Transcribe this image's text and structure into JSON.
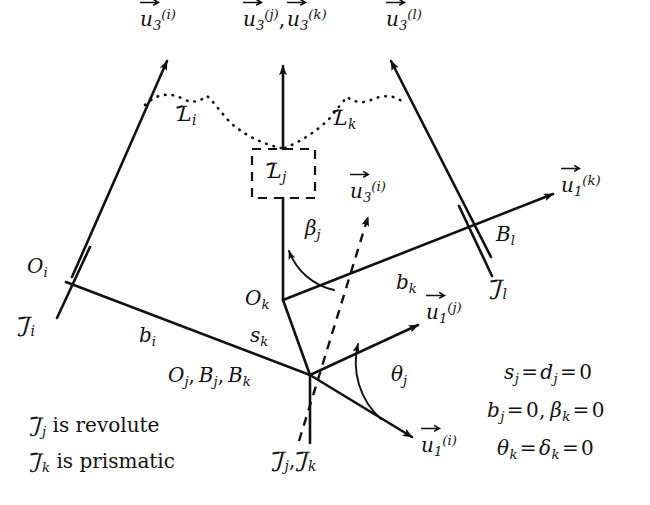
{
  "figure": {
    "type": "kinematic-chain-diagram",
    "stroke_color": "#111111",
    "background_color": "#ffffff",
    "width": 650,
    "height": 505
  },
  "vectors": {
    "u3_i_top": {
      "u": "u",
      "sub": "3",
      "sup": "(i)"
    },
    "u3_jk_top": {
      "u": "u",
      "sub": "3",
      "sup": "(j)",
      "u2": "u",
      "sub2": "3",
      "sup2": "(k)",
      "separator": ","
    },
    "u3_l_top": {
      "u": "u",
      "sub": "3",
      "sup": "(l)"
    },
    "u1_k_right": {
      "u": "u",
      "sub": "1",
      "sup": "(k)"
    },
    "u3_i_mid": {
      "u": "u",
      "sub": "3",
      "sup": "(i)"
    },
    "u1_j": {
      "u": "u",
      "sub": "1",
      "sup": "(j)"
    },
    "u1_i": {
      "u": "u",
      "sub": "1",
      "sup": "(i)"
    }
  },
  "links": {
    "L_i": {
      "letter": "L",
      "sub": "i"
    },
    "L_j": {
      "letter": "L",
      "sub": "j"
    },
    "L_k": {
      "letter": "L",
      "sub": "k"
    }
  },
  "joints": {
    "J_i": {
      "letter": "J",
      "sub": "i"
    },
    "J_l": {
      "letter": "J",
      "sub": "l"
    },
    "J_jk": {
      "letter": "J",
      "sub": "j",
      "letter2": "J",
      "sub2": "k",
      "separator": ","
    }
  },
  "points": {
    "O_i": {
      "letter": "O",
      "sub": "i"
    },
    "O_k": {
      "letter": "O",
      "sub": "k"
    },
    "B_l": {
      "letter": "B",
      "sub": "l"
    },
    "origin_group": {
      "p1": "O",
      "s1": "j",
      "p2": "B",
      "s2": "j",
      "p3": "B",
      "s3": "k"
    }
  },
  "lengths": {
    "b_i": {
      "letter": "b",
      "sub": "i"
    },
    "b_k": {
      "letter": "b",
      "sub": "k"
    },
    "s_k": {
      "letter": "s",
      "sub": "k"
    }
  },
  "angles": {
    "beta_j": {
      "letter": "β",
      "sub": "j"
    },
    "theta_j": {
      "letter": "θ",
      "sub": "j"
    }
  },
  "notes": {
    "line1": {
      "J": "J",
      "sub": "j",
      "text": " is revolute"
    },
    "line2": {
      "J": "J",
      "sub": "k",
      "text": " is prismatic"
    }
  },
  "equations": [
    {
      "id": "eq1",
      "terms": [
        {
          "v": "s",
          "sub": "j"
        },
        {
          "v": "d",
          "sub": "j"
        }
      ],
      "value": "0",
      "text": "s_j = d_j = 0"
    },
    {
      "id": "eq2",
      "text": "b_j = 0, β_k = 0"
    },
    {
      "id": "eq3",
      "text": "θ_k = δ_k = 0"
    }
  ]
}
